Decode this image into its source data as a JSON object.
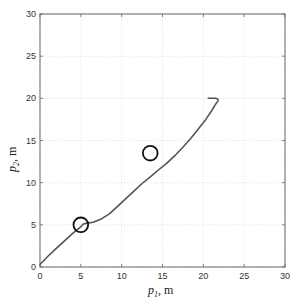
{
  "chart_data": {
    "type": "line",
    "title": "",
    "xlabel": "p1, m",
    "ylabel": "p2, m",
    "xlabel_main": "p",
    "xlabel_sub": "1",
    "xlabel_unit": ", m",
    "ylabel_main": "p",
    "ylabel_sub": "2",
    "ylabel_unit": ", m",
    "xlim": [
      0,
      30
    ],
    "ylim": [
      0,
      30
    ],
    "xticks": [
      0,
      5,
      10,
      15,
      20,
      25,
      30
    ],
    "yticks": [
      0,
      5,
      10,
      15,
      20,
      25,
      30
    ],
    "grid": true,
    "legend": null,
    "series": [
      {
        "name": "trajectory",
        "color": "#555555",
        "x": [
          0.0,
          1.0,
          2.0,
          3.0,
          4.0,
          4.8,
          5.3,
          5.8,
          6.5,
          7.5,
          8.5,
          9.5,
          10.5,
          11.5,
          12.5,
          13.5,
          14.5,
          15.5,
          16.5,
          17.5,
          18.5,
          19.5,
          20.3,
          21.0,
          21.5,
          21.8,
          21.8,
          21.5,
          21.0,
          20.6
        ],
        "y": [
          0.3,
          1.3,
          2.2,
          3.1,
          4.0,
          4.6,
          5.1,
          5.2,
          5.3,
          5.7,
          6.3,
          7.2,
          8.1,
          9.0,
          9.9,
          10.7,
          11.5,
          12.3,
          13.2,
          14.2,
          15.3,
          16.5,
          17.5,
          18.5,
          19.3,
          19.7,
          19.9,
          20.0,
          20.0,
          20.0
        ]
      }
    ],
    "markers": [
      {
        "name": "obstacle-1",
        "shape": "circle",
        "x": 5.0,
        "y": 5.0,
        "radius": 0.9
      },
      {
        "name": "obstacle-2",
        "shape": "circle",
        "x": 13.5,
        "y": 13.5,
        "radius": 0.9
      }
    ]
  }
}
